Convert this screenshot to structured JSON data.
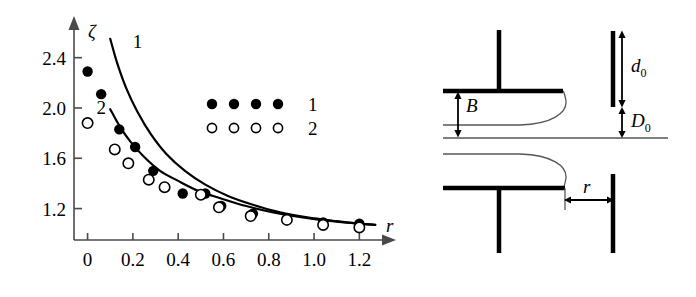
{
  "figure": {
    "title": "",
    "panels": [
      "chart-panel",
      "diagram-panel"
    ]
  },
  "chart_data": {
    "type": "scatter",
    "title": "",
    "xlabel": "r",
    "ylabel": "ζ",
    "xlim": [
      -0.06,
      1.3
    ],
    "ylim": [
      0.95,
      2.62
    ],
    "grid": false,
    "xticks": [
      0,
      0.2,
      0.4,
      0.6,
      0.8,
      1.0,
      1.2
    ],
    "xticklabels": [
      "0",
      "0.2",
      "0.4",
      "0.6",
      "0.8",
      "1.0",
      "1.2"
    ],
    "yticks": [
      1.2,
      1.6,
      2.0,
      2.4
    ],
    "yticklabels": [
      "1.2",
      "1.6",
      "2.0",
      "2.4"
    ],
    "legend_position": "upper-right-inside",
    "series": [
      {
        "name": "1",
        "marker": "filled-circle",
        "x": [
          0.0,
          0.06,
          0.14,
          0.21,
          0.29,
          0.34,
          0.42,
          0.52,
          0.59,
          0.73,
          0.88,
          1.04,
          1.2
        ],
        "y": [
          2.29,
          2.11,
          1.83,
          1.69,
          1.5,
          1.37,
          1.32,
          1.32,
          1.22,
          1.16,
          1.12,
          1.09,
          1.08
        ]
      },
      {
        "name": "2",
        "marker": "open-circle",
        "x": [
          0.0,
          0.12,
          0.18,
          0.27,
          0.34,
          0.5,
          0.58,
          0.72,
          0.88,
          1.04,
          1.2
        ],
        "y": [
          1.88,
          1.67,
          1.56,
          1.43,
          1.37,
          1.31,
          1.21,
          1.14,
          1.11,
          1.07,
          1.05
        ]
      }
    ],
    "curves": [
      {
        "name": "1",
        "label": "1",
        "label_x": 0.22,
        "label_y": 2.48,
        "points_x": [
          0.1,
          0.13,
          0.17,
          0.22,
          0.28,
          0.35,
          0.43,
          0.52,
          0.62,
          0.73,
          0.85,
          0.97,
          1.1,
          1.2,
          1.27
        ],
        "points_y": [
          2.55,
          2.36,
          2.16,
          1.97,
          1.79,
          1.63,
          1.5,
          1.39,
          1.3,
          1.23,
          1.17,
          1.13,
          1.1,
          1.08,
          1.07
        ]
      },
      {
        "name": "2",
        "label": "2",
        "label_x": 0.06,
        "label_y": 1.95,
        "points_x": [
          0.1,
          0.14,
          0.19,
          0.25,
          0.32,
          0.4,
          0.49,
          0.59,
          0.7,
          0.82,
          0.95,
          1.08,
          1.2,
          1.27
        ],
        "points_y": [
          1.99,
          1.86,
          1.73,
          1.61,
          1.5,
          1.42,
          1.34,
          1.28,
          1.22,
          1.17,
          1.13,
          1.1,
          1.08,
          1.07
        ]
      }
    ],
    "legend": [
      {
        "label": "1",
        "marker": "filled-circle",
        "count": 4
      },
      {
        "label": "2",
        "marker": "open-circle",
        "count": 4
      }
    ]
  },
  "diagram": {
    "name": "nozzle-plate-schematic",
    "labels": {
      "b": "B",
      "d0_main": "d",
      "d0_sub": "0",
      "dcap0_main": "D",
      "dcap0_sub": "0",
      "r": "r"
    },
    "parts": [
      "upper-nozzle-stem",
      "upper-plate",
      "upper-jet-profile",
      "free-surface-line",
      "lower-nozzle-stem",
      "lower-plate",
      "lower-jet-profile",
      "target-bar-upper",
      "target-bar-lower",
      "b-dimension-arrow",
      "d0-dimension-arrow",
      "D0-dimension-arrow",
      "r-dimension-arrow"
    ]
  }
}
